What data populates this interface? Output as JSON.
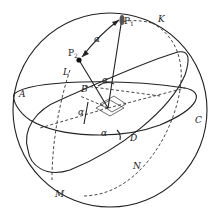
{
  "figure": {
    "type": "celestial-sphere-diagram",
    "labels": {
      "P1": "P",
      "P1_sub": "1",
      "P2": "P",
      "P2_sub": "2",
      "K": "K",
      "L": "L",
      "B": "B",
      "A": "A",
      "C": "C",
      "D": "D",
      "N": "N",
      "M": "M",
      "alpha_top": "α",
      "alpha_B": "α",
      "alpha_left": "α",
      "alpha_D": "α"
    },
    "colors": {
      "stroke": "#222222",
      "background": "#ffffff"
    }
  }
}
